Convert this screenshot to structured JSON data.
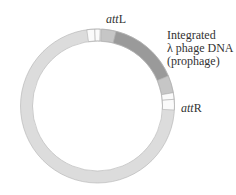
{
  "diagram": {
    "ring": {
      "center": [
        97.5,
        106
      ],
      "outer_radius": 77,
      "inner_radius": 65,
      "colors": {
        "bacterial": "#dcdcdc",
        "att_site": "#fafafa",
        "flank": "#c6c6c6",
        "prophage": "#9a9a9a",
        "outline": "#b0b0b0"
      },
      "segments": [
        {
          "name": "attL-left",
          "start": -8,
          "end": -2,
          "color": "att_site"
        },
        {
          "name": "attL-right",
          "start": -2,
          "end": 2,
          "color": "att_site"
        },
        {
          "name": "flank-left",
          "start": 3,
          "end": 14,
          "color": "flank"
        },
        {
          "name": "prophage",
          "start": 14,
          "end": 67,
          "color": "prophage"
        },
        {
          "name": "flank-right",
          "start": 67,
          "end": 80,
          "color": "flank"
        },
        {
          "name": "attR-top",
          "start": 80,
          "end": 85,
          "color": "att_site"
        },
        {
          "name": "attR-bottom",
          "start": 85,
          "end": 93,
          "color": "att_site"
        }
      ]
    },
    "labels": {
      "attL": {
        "italic": "att",
        "roman": "L"
      },
      "attR": {
        "italic": "att",
        "roman": "R"
      },
      "prophage": [
        "Integrated",
        "λ phage DNA",
        "(prophage)"
      ]
    }
  }
}
